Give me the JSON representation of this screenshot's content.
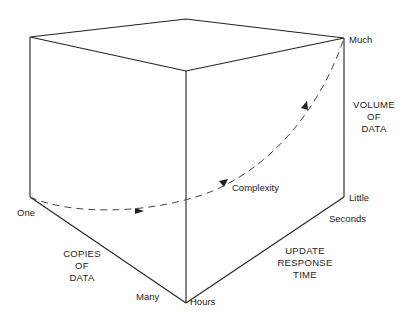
{
  "diagram": {
    "type": "cube-3d-axes",
    "axes": {
      "copies": {
        "title": [
          "COPIES",
          "OF",
          "DATA"
        ],
        "low": "One",
        "high": "Many"
      },
      "response": {
        "title": [
          "UPDATE",
          "RESPONSE",
          "TIME"
        ],
        "low": "Hours",
        "high": "Seconds"
      },
      "volume": {
        "title": [
          "VOLUME",
          "OF",
          "DATA"
        ],
        "low": "Little",
        "high": "Much"
      }
    },
    "curve": {
      "label": "Complexity",
      "style": "dashed",
      "from": "One",
      "to": "Much"
    },
    "colors": {
      "line": "#222222",
      "dash": "#444444",
      "background": "#ffffff"
    }
  }
}
